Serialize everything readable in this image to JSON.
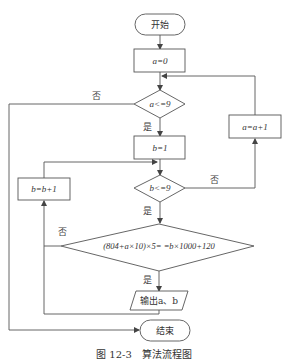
{
  "flowchart": {
    "start": "开始",
    "init_a": "a=0",
    "cond_a": "a<=9",
    "init_b": "b=1",
    "inc_a": "a=a+1",
    "cond_b": "b<=9",
    "inc_b": "b=b+1",
    "cond_eq": "(804+a×10)×5= =b×1000+120",
    "output": "输出a、b",
    "end": "结束",
    "labels": {
      "no_a": "否",
      "yes_a": "是",
      "no_b": "否",
      "yes_b": "是",
      "no_eq": "否",
      "yes_eq": "是"
    },
    "colors": {
      "stroke": "#555555",
      "text": "#333333",
      "background": "#ffffff"
    }
  },
  "caption": "图 12-3　算法流程图"
}
